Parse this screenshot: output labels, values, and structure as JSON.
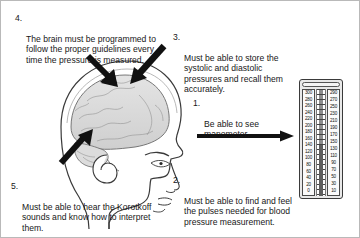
{
  "diagram": {
    "callouts": [
      {
        "number": "1.",
        "text": "Be able to see manometer.",
        "points_to": "manometer"
      },
      {
        "number": "2.",
        "text": "Must be able to find and feel the pulses needed for blood pressure measurement.",
        "points_to": "hand"
      },
      {
        "number": "3.",
        "text": "Must be able to store the systolic and diastolic pressures and recall them accurately.",
        "points_to": "brain"
      },
      {
        "number": "4.",
        "text": "The brain must be programmed to follow the proper guidelines every time the pressure is measured.",
        "points_to": "brain"
      },
      {
        "number": "5.",
        "text": "Must be able to hear the Korotkoff sounds and know how to interpret them.",
        "points_to": "ear"
      }
    ],
    "figure": {
      "name": "head-profile-with-brain",
      "description": "Side profile of a human head showing the brain and ear"
    },
    "manometer": {
      "name": "mercury-manometer",
      "scale_left": [
        "300",
        "280",
        "260",
        "240",
        "220",
        "200",
        "180",
        "160",
        "140",
        "120",
        "100",
        "80",
        "60",
        "40",
        "20",
        "0"
      ],
      "scale_right": [
        "290",
        "270",
        "250",
        "230",
        "210",
        "190",
        "170",
        "150",
        "130",
        "110",
        "90",
        "70",
        "50",
        "30",
        "10"
      ]
    },
    "arrows": [
      {
        "name": "arrow-to-brain-left",
        "direction": "down-right"
      },
      {
        "name": "arrow-to-brain-right",
        "direction": "down-left"
      },
      {
        "name": "arrow-to-ear",
        "direction": "up-right"
      },
      {
        "name": "arrow-to-manometer",
        "direction": "right"
      }
    ],
    "colors": {
      "ink": "#181818",
      "border": "#b9b9b9",
      "manometer_body": "#e9e9e9",
      "mercury": "#5e5e5e"
    }
  }
}
